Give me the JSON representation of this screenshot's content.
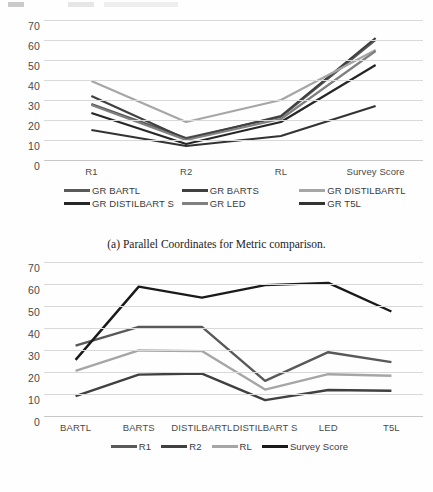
{
  "page": {
    "top_partial_text": ""
  },
  "figures": [
    {
      "id": "figure-a",
      "caption": "(a) Parallel Coordinates for Metric comparison.",
      "chart_data": {
        "type": "line",
        "title": "",
        "xlabel": "",
        "ylabel": "",
        "categories": [
          "R1",
          "R2",
          "RL",
          "Survey Score"
        ],
        "ylim": [
          0,
          70
        ],
        "yticks": [
          0,
          10,
          20,
          30,
          40,
          50,
          60,
          70
        ],
        "grid": true,
        "legend_position": "bottom",
        "series": [
          {
            "name": "GR BARTL",
            "values": [
              28.0,
              11.0,
              21.5,
              60.0
            ],
            "color": "#595959"
          },
          {
            "name": "GR BARTS",
            "values": [
              32.0,
              10.5,
              22.0,
              61.0
            ],
            "color": "#404040"
          },
          {
            "name": "GR DISTILBARTL",
            "values": [
              39.5,
              19.0,
              30.0,
              55.0
            ],
            "color": "#a6a6a6"
          },
          {
            "name": "GR DISTILBART S",
            "values": [
              23.5,
              8.0,
              19.0,
              47.5
            ],
            "color": "#262626"
          },
          {
            "name": "GR LED",
            "values": [
              27.5,
              10.0,
              20.5,
              54.5
            ],
            "color": "#808080"
          },
          {
            "name": "GR T5L",
            "values": [
              15.0,
              7.0,
              12.0,
              27.0
            ],
            "color": "#333333"
          }
        ]
      }
    },
    {
      "id": "figure-b",
      "caption": "(b) Parallel Coordinates for Method comparison.",
      "chart_data": {
        "type": "line",
        "title": "",
        "xlabel": "",
        "ylabel": "",
        "categories": [
          "BARTL",
          "BARTS",
          "DISTILBARTL",
          "DISTILBART S",
          "LED",
          "T5L"
        ],
        "ylim": [
          0,
          70
        ],
        "yticks": [
          0,
          10,
          20,
          30,
          40,
          50,
          60,
          70
        ],
        "grid": true,
        "legend_position": "bottom",
        "series": [
          {
            "name": "R1",
            "values": [
              32.0,
              40.5,
              40.5,
              16.0,
              29.0,
              24.5
            ],
            "color": "#595959"
          },
          {
            "name": "R2",
            "values": [
              9.0,
              18.8,
              19.3,
              7.2,
              11.8,
              11.5
            ],
            "color": "#404040"
          },
          {
            "name": "RL",
            "values": [
              20.5,
              29.8,
              29.5,
              12.0,
              19.0,
              18.3
            ],
            "color": "#a6a6a6"
          },
          {
            "name": "Survey Score",
            "values": [
              25.5,
              58.8,
              53.8,
              59.5,
              60.5,
              47.5
            ],
            "color": "#1a1a1a"
          }
        ]
      }
    }
  ]
}
